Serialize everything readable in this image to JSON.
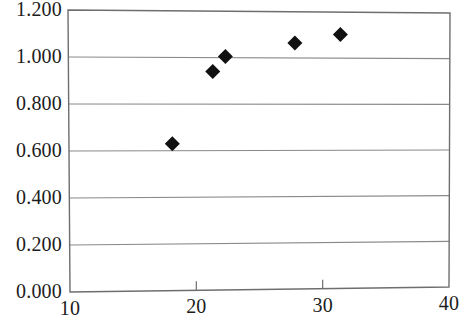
{
  "chart_data": {
    "type": "scatter",
    "title": "",
    "subtitle": "",
    "xlabel": "",
    "ylabel": "",
    "xlim": [
      10,
      40
    ],
    "ylim": [
      0.0,
      1.2
    ],
    "grid": true,
    "grid_axis": "y",
    "legend": false,
    "legend_position": "none",
    "marker": "filled-diamond",
    "marker_color": "#111111",
    "series": [
      {
        "name": "series-1",
        "points": [
          {
            "x": 18.1,
            "y": 0.63
          },
          {
            "x": 21.3,
            "y": 0.94
          },
          {
            "x": 22.3,
            "y": 1.005
          },
          {
            "x": 27.8,
            "y": 1.065
          },
          {
            "x": 31.4,
            "y": 1.103
          }
        ]
      }
    ],
    "x_ticks": [
      {
        "value": 10,
        "label": "10"
      },
      {
        "value": 20,
        "label": "20"
      },
      {
        "value": 30,
        "label": "30"
      },
      {
        "value": 40,
        "label": "40"
      }
    ],
    "y_ticks": [
      {
        "value": 0.0,
        "label": "0.000"
      },
      {
        "value": 0.2,
        "label": "0.200"
      },
      {
        "value": 0.4,
        "label": "0.400"
      },
      {
        "value": 0.6,
        "label": "0.600"
      },
      {
        "value": 0.8,
        "label": "0.800"
      },
      {
        "value": 1.0,
        "label": "1.000"
      },
      {
        "value": 1.2,
        "label": "1.200"
      }
    ],
    "colors": {
      "axis": "#6e6e6e",
      "grid": "#8a8a8a",
      "marker": "#111111",
      "text": "#1c1c1c",
      "background": "#ffffff"
    }
  }
}
